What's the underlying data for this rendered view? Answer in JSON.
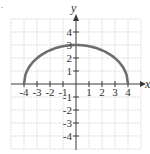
{
  "chart_data": {
    "type": "line",
    "title": "",
    "xlabel": "x",
    "ylabel": "y",
    "xlim": [
      -5,
      5
    ],
    "ylim": [
      -5,
      5
    ],
    "grid": true,
    "x_ticks": [
      -4,
      -3,
      -2,
      -1,
      1,
      2,
      3,
      4
    ],
    "y_ticks": [
      4,
      3,
      2,
      1,
      -1,
      -2,
      -3,
      -4
    ],
    "x_tick_labels": [
      "-4",
      "-3",
      "-2",
      "-1",
      "1",
      "2",
      "3",
      "4"
    ],
    "y_tick_labels": [
      "4",
      "3",
      "2",
      "1",
      "-1",
      "-2",
      "-3",
      "-4"
    ],
    "series": [
      {
        "name": "upper half-ellipse",
        "description": "y = 3*sqrt(1 - x^2/16), -4 <= x <= 4",
        "x": [
          -4,
          -3,
          -2,
          -1,
          0,
          1,
          2,
          3,
          4
        ],
        "values": [
          0,
          1.98,
          2.6,
          2.9,
          3,
          2.9,
          2.6,
          1.98,
          0
        ]
      }
    ],
    "color": "#6e6e6e"
  },
  "labels": {
    "x_axis": "x",
    "y_axis": "y",
    "corner_mark": "."
  }
}
